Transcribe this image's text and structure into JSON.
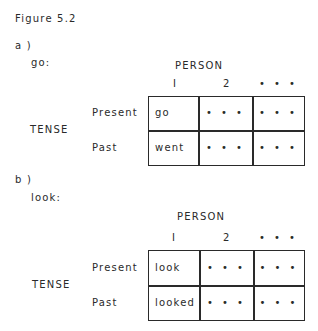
{
  "figure": {
    "title": "Figure 5.2",
    "panels": [
      {
        "label": "a )",
        "verb": "go:",
        "column_header": "PERSON",
        "row_header": "TENSE",
        "columns": [
          "I",
          "2",
          "• • •"
        ],
        "rows": [
          {
            "label": "Present",
            "cells": [
              "go",
              "• • •",
              "• • •"
            ]
          },
          {
            "label": "Past",
            "cells": [
              "went",
              "• • •",
              "• • •"
            ]
          }
        ]
      },
      {
        "label": "b )",
        "verb": "look:",
        "column_header": "PERSON",
        "row_header": "TENSE",
        "columns": [
          "I",
          "2",
          "• • •"
        ],
        "rows": [
          {
            "label": "Present",
            "cells": [
              "look",
              "• • •",
              "• • •"
            ]
          },
          {
            "label": "Past",
            "cells": [
              "looked",
              "• • •",
              "• • •"
            ]
          }
        ]
      }
    ]
  }
}
